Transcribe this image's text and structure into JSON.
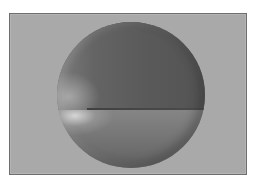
{
  "image": {
    "subject": "rendered shaded sphere",
    "description": "Gray 3D-shaded sphere with a horizontal seam and a left-side specular highlight, shown inside a bordered gray frame",
    "colors": {
      "background": "#a9a9a9",
      "frame_border": "#6e6e6e",
      "sphere_upper": "#5a5a5a",
      "sphere_lower": "#7a7a7a",
      "highlight": "#e6e6e6"
    }
  }
}
